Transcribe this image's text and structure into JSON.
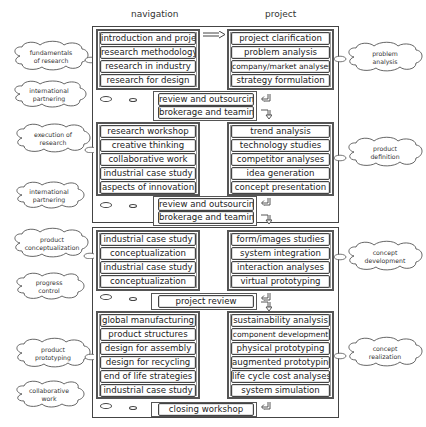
{
  "headers": {
    "left": "navigation",
    "right": "project"
  },
  "phases": [
    {
      "navigation": [
        "introduction and project",
        "research methodology",
        "research in industry",
        "research for design"
      ],
      "project": [
        "project clarification",
        "problem analysis",
        "company/market analyses",
        "strategy formulation"
      ],
      "review": [
        "review and outsourcing",
        "brokerage and teaming"
      ]
    },
    {
      "navigation": [
        "research workshop",
        "creative thinking",
        "collaborative work",
        "industrial case study",
        "aspects of innovation"
      ],
      "project": [
        "trend analysis",
        "technology studies",
        "competitor analyses",
        "idea generation",
        "concept presentation"
      ],
      "review": [
        "review and outsourcing",
        "brokerage and teaming"
      ]
    },
    {
      "navigation": [
        "industrial case study",
        "conceptualization",
        "industrial case study",
        "conceptualization"
      ],
      "project": [
        "form/images studies",
        "system integration",
        "interaction analyses",
        "virtual prototyping"
      ],
      "review": [
        "project review"
      ]
    },
    {
      "navigation": [
        "global manufacturing",
        "product structures",
        "design for assembly",
        "design for recycling",
        "end of life strategies",
        "industrial case study"
      ],
      "project": [
        "sustainability analysis",
        "component development",
        "physical prototyping",
        "augmented prototyping",
        "life cycle cost analyses",
        "system simulation"
      ],
      "review": [
        "closing workshop"
      ]
    }
  ],
  "left_clouds": [
    [
      "fundamentals",
      "of research"
    ],
    [
      "international",
      "partnering"
    ],
    [
      "execution of",
      "research"
    ],
    [
      "international",
      "partnering"
    ],
    [
      "product",
      "conceptualization"
    ],
    [
      "progress",
      "control"
    ],
    [
      "product",
      "prototyping"
    ],
    [
      "collaborative",
      "work"
    ]
  ],
  "right_clouds": [
    [
      "problem",
      "analysis"
    ],
    [
      "product",
      "definition"
    ],
    [
      "concept",
      "development"
    ],
    [
      "concept",
      "realization"
    ]
  ]
}
